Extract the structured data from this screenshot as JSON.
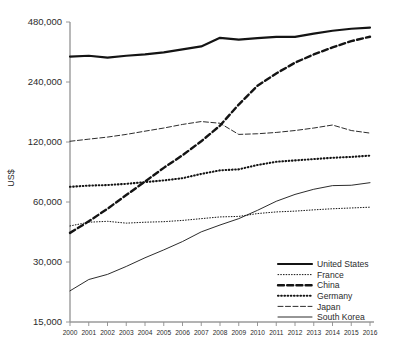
{
  "chart_data": {
    "type": "line",
    "title": "",
    "xlabel": "",
    "ylabel": "US$",
    "yscale": "log",
    "ylim": [
      15000,
      480000
    ],
    "grid": false,
    "legend_position": "bottom-right",
    "x": [
      2000,
      2001,
      2002,
      2003,
      2004,
      2005,
      2006,
      2007,
      2008,
      2009,
      2010,
      2011,
      2012,
      2013,
      2014,
      2015,
      2016
    ],
    "categories": [
      "2000",
      "2001",
      "2002",
      "2003",
      "2004",
      "2005",
      "2006",
      "2007",
      "2008",
      "2009",
      "2010",
      "2011",
      "2012",
      "2013",
      "2014",
      "2015",
      "2016"
    ],
    "ytick_labels": [
      "480,000",
      "240,000",
      "120,000",
      "60,000",
      "30,000",
      "15,000"
    ],
    "ytick_values": [
      480000,
      240000,
      120000,
      60000,
      30000,
      15000
    ],
    "series": [
      {
        "name": "United States",
        "style": "solid-thick",
        "values": [
          322000,
          325000,
          318000,
          325000,
          330000,
          338000,
          350000,
          362000,
          400000,
          392000,
          398000,
          404000,
          404000,
          420000,
          434000,
          444000,
          450000
        ]
      },
      {
        "name": "France",
        "style": "dotted-fine",
        "values": [
          45500,
          47500,
          48000,
          47000,
          47500,
          47800,
          48500,
          49500,
          50500,
          50800,
          52500,
          53500,
          54000,
          54800,
          55500,
          56000,
          56500
        ]
      },
      {
        "name": "China",
        "style": "dashed-thick",
        "values": [
          42000,
          48000,
          55500,
          65000,
          76000,
          89000,
          103000,
          121000,
          145000,
          185000,
          230000,
          265000,
          300000,
          330000,
          358000,
          385000,
          405000
        ]
      },
      {
        "name": "Germany",
        "style": "dotted-thick",
        "values": [
          71500,
          72500,
          73000,
          74000,
          75500,
          77000,
          79000,
          83000,
          86500,
          87500,
          92000,
          95500,
          97000,
          98500,
          100000,
          101000,
          102500
        ]
      },
      {
        "name": "Japan",
        "style": "dashed-thin",
        "values": [
          121000,
          124000,
          127000,
          131000,
          136000,
          141000,
          147000,
          152000,
          149000,
          131000,
          132000,
          134000,
          137000,
          141000,
          146000,
          137000,
          133000
        ]
      },
      {
        "name": "South Korea",
        "style": "solid-thin",
        "values": [
          21500,
          24500,
          26000,
          28500,
          31500,
          34500,
          38000,
          42500,
          46000,
          49500,
          54500,
          60500,
          65500,
          69500,
          72500,
          72800,
          75000
        ]
      }
    ]
  },
  "legend": {
    "items": [
      {
        "label": "United States",
        "style": "solid-thick"
      },
      {
        "label": "France",
        "style": "dotted-fine"
      },
      {
        "label": "China",
        "style": "dashed-thick"
      },
      {
        "label": "Germany",
        "style": "dotted-thick"
      },
      {
        "label": "Japan",
        "style": "dashed-thin"
      },
      {
        "label": "South Korea",
        "style": "solid-thin"
      }
    ]
  },
  "colors": {
    "ink": "#141414",
    "axis": "#9a9a9a",
    "label": "#2b2b2b",
    "background": "#ffffff"
  }
}
